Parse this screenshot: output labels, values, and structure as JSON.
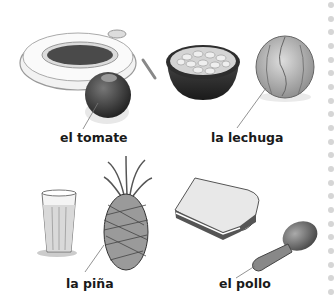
{
  "vocabulary": [
    {
      "label": "el tomate"
    },
    {
      "label": "la lechuga"
    },
    {
      "label": "la piña"
    },
    {
      "label": "el pollo"
    }
  ],
  "illustrations": [
    "tray",
    "tomato",
    "bowl-of-beans",
    "lettuce",
    "glass-of-juice",
    "pineapple",
    "sandwich",
    "chicken-leg"
  ],
  "colors": {
    "dots": "#d6d6d6",
    "text": "#1a1a1a"
  }
}
